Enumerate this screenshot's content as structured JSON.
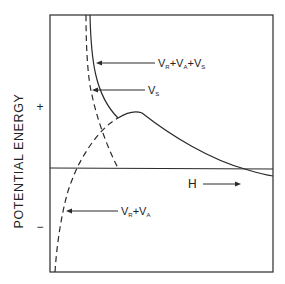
{
  "diagram": {
    "y_axis_label": "POTENTIAL ENERGY",
    "plus_sign": "+",
    "minus_sign": "−",
    "x_label": "H",
    "curves": [
      {
        "name": "total",
        "label_main": "V",
        "label_sub": "R",
        "label_rest": "+V",
        "label_sub2": "A",
        "label_rest2": "+V",
        "label_sub3": "S",
        "style": "solid"
      },
      {
        "name": "steric",
        "label_main": "V",
        "label_sub": "S",
        "style": "dashed"
      },
      {
        "name": "dlvo",
        "label_main": "V",
        "label_sub": "R",
        "label_rest": "+V",
        "label_sub2": "A",
        "style": "dashed"
      }
    ],
    "colors": {
      "line": "#2a2a2a",
      "background": "#ffffff"
    }
  }
}
